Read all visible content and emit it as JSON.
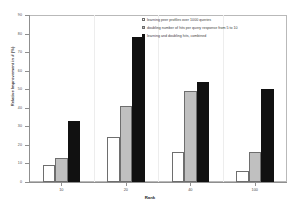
{
  "chart_data": {
    "type": "bar",
    "title": "",
    "xlabel": "Rank",
    "ylabel": "Relative Improvement in # (%)",
    "categories": [
      "10",
      "20",
      "40",
      "100"
    ],
    "series": [
      {
        "name": "learning peer profiles over 1000 queries",
        "color": "#ffffff",
        "values": [
          9,
          24,
          16,
          6
        ]
      },
      {
        "name": "doubling number of hits per query response from 5 to 10",
        "color": "#c0c0c0",
        "values": [
          13,
          41,
          49,
          16
        ]
      },
      {
        "name": "learning and doubling hits, combined",
        "color": "#111111",
        "values": [
          33,
          78,
          54,
          50
        ]
      }
    ],
    "ylim": [
      0,
      90
    ],
    "yticks": [
      0,
      10,
      20,
      30,
      40,
      50,
      60,
      70,
      80,
      90
    ],
    "ytick_labels": [
      "0",
      "10",
      "20",
      "30",
      "40",
      "50",
      "60",
      "70",
      "80",
      "90"
    ],
    "grid": false,
    "legend_position": "top-right"
  },
  "legend": {
    "entries": [
      {
        "label": "learning peer profiles over 1000 queries",
        "swatch": "white-swatch"
      },
      {
        "label": "doubling number of hits per query response from 5 to 10",
        "swatch": "gray-swatch"
      },
      {
        "label": "learning and doubling hits, combined",
        "swatch": "black-swatch"
      }
    ]
  }
}
